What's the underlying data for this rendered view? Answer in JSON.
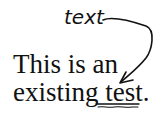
{
  "annotation": {
    "handwritten_insert": "text",
    "mark_type": "replace-word-arrow"
  },
  "document": {
    "line1": "This is an",
    "line2_prefix": "existing ",
    "line2_marked_word": "test.",
    "marked_word_style": "underlined"
  },
  "colors": {
    "ink": "#111111",
    "background": "#ffffff"
  }
}
